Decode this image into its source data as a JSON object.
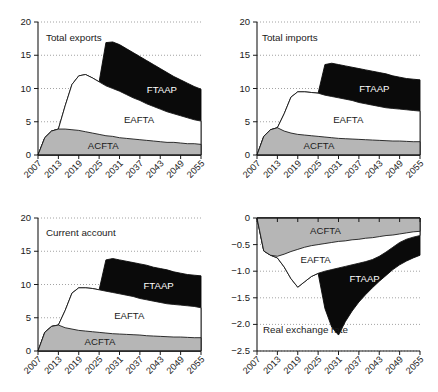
{
  "figure": {
    "panel_count": 4,
    "x_tick_labels": [
      "2007",
      "2013",
      "2019",
      "2025",
      "2031",
      "2037",
      "2043",
      "2049",
      "2055"
    ],
    "colors": {
      "acfta": "#b6b6b6",
      "eafta": "#ffffff",
      "ftaap": "#0a0a0a",
      "axis": "#1a1a1a",
      "grid": "#8c8c8c"
    }
  },
  "chart_data": [
    {
      "type": "area",
      "panel": "total-exports",
      "title": "Total exports",
      "xlabel": "",
      "ylabel": "",
      "xlim": [
        2007,
        2055
      ],
      "ylim": [
        0,
        20
      ],
      "y_tick_labels": [
        "0",
        "5",
        "10",
        "15",
        "20"
      ],
      "y_ticks": [
        0,
        5,
        10,
        15,
        20
      ],
      "x_tick_labels": [
        "2007",
        "2013",
        "2019",
        "2025",
        "2031",
        "2037",
        "2043",
        "2049",
        "2055"
      ],
      "grid": true,
      "legend": "inline-labels",
      "x": [
        2007,
        2009,
        2011,
        2013,
        2015,
        2017,
        2019,
        2021,
        2023,
        2025,
        2027,
        2029,
        2031,
        2033,
        2035,
        2037,
        2039,
        2041,
        2043,
        2045,
        2047,
        2049,
        2051,
        2053,
        2055
      ],
      "series": [
        {
          "name": "ACFTA",
          "values": [
            0.0,
            2.6,
            3.6,
            3.9,
            3.9,
            3.8,
            3.7,
            3.5,
            3.3,
            3.1,
            2.9,
            2.8,
            2.6,
            2.5,
            2.4,
            2.3,
            2.2,
            2.1,
            2.0,
            1.9,
            1.9,
            1.8,
            1.7,
            1.7,
            1.6
          ]
        },
        {
          "name": "EAFTA",
          "values": [
            0.0,
            2.6,
            3.6,
            3.9,
            7.4,
            10.6,
            11.9,
            12.1,
            11.6,
            11.0,
            10.4,
            10.0,
            9.6,
            9.1,
            8.6,
            8.2,
            7.7,
            7.3,
            6.9,
            6.5,
            6.2,
            5.9,
            5.6,
            5.3,
            5.1
          ]
        },
        {
          "name": "FTAAP",
          "values": [
            0.0,
            2.6,
            3.6,
            3.9,
            7.4,
            10.6,
            11.9,
            12.1,
            11.6,
            11.0,
            16.9,
            17.0,
            16.6,
            16.0,
            15.4,
            14.8,
            14.2,
            13.6,
            13.0,
            12.4,
            11.8,
            11.3,
            10.8,
            10.3,
            9.9
          ]
        }
      ],
      "band_labels": [
        {
          "text": "ACFTA",
          "on_dark": false
        },
        {
          "text": "EAFTA",
          "on_dark": false
        },
        {
          "text": "FTAAP",
          "on_dark": true
        }
      ]
    },
    {
      "type": "area",
      "panel": "total-imports",
      "title": "Total imports",
      "xlabel": "",
      "ylabel": "",
      "xlim": [
        2007,
        2055
      ],
      "ylim": [
        0,
        20
      ],
      "y_tick_labels": [
        "0",
        "5",
        "10",
        "15",
        "20"
      ],
      "y_ticks": [
        0,
        5,
        10,
        15,
        20
      ],
      "x_tick_labels": [
        "2007",
        "2013",
        "2019",
        "2025",
        "2031",
        "2037",
        "2043",
        "2049",
        "2055"
      ],
      "grid": true,
      "legend": "inline-labels",
      "x": [
        2007,
        2009,
        2011,
        2013,
        2015,
        2017,
        2019,
        2021,
        2023,
        2025,
        2027,
        2029,
        2031,
        2033,
        2035,
        2037,
        2039,
        2041,
        2043,
        2045,
        2047,
        2049,
        2051,
        2053,
        2055
      ],
      "series": [
        {
          "name": "ACFTA",
          "values": [
            0.0,
            2.8,
            3.8,
            4.1,
            3.6,
            3.3,
            3.1,
            3.0,
            2.9,
            2.8,
            2.7,
            2.6,
            2.5,
            2.45,
            2.4,
            2.35,
            2.3,
            2.25,
            2.2,
            2.15,
            2.1,
            2.1,
            2.05,
            2.0,
            2.0
          ]
        },
        {
          "name": "EAFTA",
          "values": [
            0.0,
            2.8,
            3.8,
            4.1,
            6.2,
            8.7,
            9.5,
            9.5,
            9.4,
            9.3,
            9.0,
            8.8,
            8.6,
            8.4,
            8.2,
            7.9,
            7.7,
            7.5,
            7.3,
            7.1,
            7.0,
            6.9,
            6.8,
            6.7,
            6.6
          ]
        },
        {
          "name": "FTAAP",
          "values": [
            0.0,
            2.8,
            3.8,
            4.1,
            6.2,
            8.7,
            9.5,
            9.5,
            9.4,
            9.3,
            13.6,
            13.8,
            13.6,
            13.4,
            13.2,
            13.0,
            12.8,
            12.6,
            12.4,
            12.2,
            11.9,
            11.7,
            11.5,
            11.4,
            11.3
          ]
        }
      ],
      "band_labels": [
        {
          "text": "ACFTA",
          "on_dark": false
        },
        {
          "text": "EAFTA",
          "on_dark": false
        },
        {
          "text": "FTAAP",
          "on_dark": true
        }
      ]
    },
    {
      "type": "area",
      "panel": "current-account",
      "title": "Current account",
      "xlabel": "",
      "ylabel": "",
      "xlim": [
        2007,
        2055
      ],
      "ylim": [
        0,
        20
      ],
      "y_tick_labels": [
        "0",
        "5",
        "10",
        "15",
        "20"
      ],
      "y_ticks": [
        0,
        5,
        10,
        15,
        20
      ],
      "x_tick_labels": [
        "2007",
        "2013",
        "2019",
        "2025",
        "2031",
        "2037",
        "2043",
        "2049",
        "2055"
      ],
      "grid": true,
      "legend": "inline-labels",
      "x": [
        2007,
        2009,
        2011,
        2013,
        2015,
        2017,
        2019,
        2021,
        2023,
        2025,
        2027,
        2029,
        2031,
        2033,
        2035,
        2037,
        2039,
        2041,
        2043,
        2045,
        2047,
        2049,
        2051,
        2053,
        2055
      ],
      "series": [
        {
          "name": "ACFTA",
          "values": [
            0.0,
            2.8,
            3.7,
            3.9,
            3.5,
            3.3,
            3.1,
            3.0,
            2.9,
            2.8,
            2.7,
            2.6,
            2.55,
            2.5,
            2.45,
            2.4,
            2.3,
            2.25,
            2.2,
            2.15,
            2.1,
            2.1,
            2.05,
            2.0,
            2.0
          ]
        },
        {
          "name": "EAFTA",
          "values": [
            0.0,
            2.8,
            3.7,
            3.9,
            6.1,
            8.7,
            9.5,
            9.5,
            9.4,
            9.2,
            9.0,
            8.8,
            8.6,
            8.4,
            8.2,
            7.9,
            7.7,
            7.5,
            7.3,
            7.1,
            7.0,
            6.9,
            6.8,
            6.7,
            6.5
          ]
        },
        {
          "name": "FTAAP",
          "values": [
            0.0,
            2.8,
            3.7,
            3.9,
            6.1,
            8.7,
            9.5,
            9.5,
            9.4,
            9.2,
            13.7,
            13.9,
            13.7,
            13.5,
            13.3,
            13.1,
            12.9,
            12.6,
            12.4,
            12.2,
            11.9,
            11.7,
            11.5,
            11.4,
            11.3
          ]
        }
      ],
      "band_labels": [
        {
          "text": "ACFTA",
          "on_dark": false
        },
        {
          "text": "EAFTA",
          "on_dark": false
        },
        {
          "text": "FTAAP",
          "on_dark": true
        }
      ]
    },
    {
      "type": "area",
      "panel": "real-exchange-rate",
      "title": "Real exchange rate",
      "xlabel": "",
      "ylabel": "",
      "xlim": [
        2007,
        2055
      ],
      "ylim": [
        -2.5,
        0
      ],
      "y_tick_labels": [
        "-2.5",
        "-2.0",
        "-1.5",
        "-1.0",
        "-0.5",
        "0"
      ],
      "y_ticks": [
        -2.5,
        -2.0,
        -1.5,
        -1.0,
        -0.5,
        0
      ],
      "x_tick_labels": [
        "2007",
        "2013",
        "2019",
        "2025",
        "2031",
        "2037",
        "2043",
        "2049",
        "2055"
      ],
      "grid": true,
      "legend": "inline-labels",
      "x": [
        2007,
        2009,
        2011,
        2013,
        2015,
        2017,
        2019,
        2021,
        2023,
        2025,
        2027,
        2029,
        2031,
        2033,
        2035,
        2037,
        2039,
        2041,
        2043,
        2045,
        2047,
        2049,
        2051,
        2053,
        2055
      ],
      "series": [
        {
          "name": "ACFTA",
          "values": [
            0.0,
            -0.62,
            -0.7,
            -0.72,
            -0.68,
            -0.63,
            -0.59,
            -0.55,
            -0.52,
            -0.5,
            -0.48,
            -0.46,
            -0.44,
            -0.43,
            -0.41,
            -0.4,
            -0.38,
            -0.37,
            -0.35,
            -0.33,
            -0.32,
            -0.3,
            -0.28,
            -0.26,
            -0.25
          ]
        },
        {
          "name": "EAFTA",
          "values": [
            0.0,
            -0.62,
            -0.7,
            -0.75,
            -0.92,
            -1.14,
            -1.3,
            -1.2,
            -1.1,
            -1.04,
            -1.0,
            -0.97,
            -0.94,
            -0.91,
            -0.88,
            -0.85,
            -0.82,
            -0.78,
            -0.72,
            -0.64,
            -0.55,
            -0.46,
            -0.4,
            -0.36,
            -0.33
          ]
        },
        {
          "name": "FTAAP",
          "values": [
            0.0,
            -0.62,
            -0.7,
            -0.75,
            -0.92,
            -1.14,
            -1.3,
            -1.2,
            -1.1,
            -1.04,
            -1.7,
            -2.05,
            -2.2,
            -1.95,
            -1.75,
            -1.58,
            -1.44,
            -1.31,
            -1.19,
            -1.08,
            -0.97,
            -0.88,
            -0.81,
            -0.75,
            -0.7
          ]
        }
      ],
      "band_labels": [
        {
          "text": "ACFTA",
          "on_dark": false
        },
        {
          "text": "EAFTA",
          "on_dark": false
        },
        {
          "text": "FTAAP",
          "on_dark": true
        }
      ]
    }
  ]
}
